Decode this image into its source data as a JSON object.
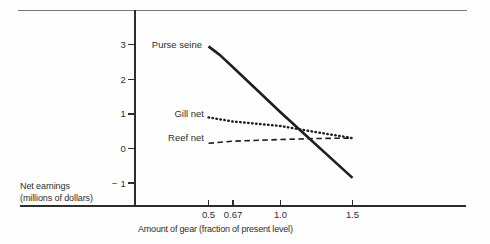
{
  "figure": {
    "background": "#fefefe",
    "top_rule_color": "#7a7a7a",
    "axis_color": "#2d2d2d",
    "text_color": "#2e2e2e",
    "series_line_color": "#1f1f1f"
  },
  "chart_data": {
    "type": "line",
    "title": "",
    "xlabel": "Amount of gear (fraction of present level)",
    "ylabel": "Net earnings (millions of dollars)",
    "ylabel_lines": [
      "Net earnings",
      "(millions of dollars)"
    ],
    "x_tick_values": [
      0.5,
      0.67,
      1.0,
      1.5
    ],
    "x_tick_labels": [
      "0.5",
      "0.67",
      "1.0",
      "1.5"
    ],
    "y_tick_values": [
      3,
      2,
      1,
      0,
      -1
    ],
    "y_tick_labels": [
      "3",
      "2",
      "1",
      "0",
      "− 1"
    ],
    "xlim": [
      0.0,
      2.3
    ],
    "ylim": [
      -1.7,
      4.0
    ],
    "grid": false,
    "legend_position": "inline-labels-left-of-lines",
    "series": [
      {
        "name": "Purse seine",
        "line_style": "solid",
        "x": [
          0.5,
          0.58,
          0.67,
          1.0,
          1.5
        ],
        "y": [
          2.95,
          2.7,
          2.35,
          1.05,
          -0.85
        ]
      },
      {
        "name": "Gill net",
        "line_style": "dotted",
        "x": [
          0.5,
          0.67,
          1.0,
          1.25,
          1.5
        ],
        "y": [
          0.9,
          0.78,
          0.65,
          0.47,
          0.3
        ]
      },
      {
        "name": "Reef net",
        "line_style": "dashed",
        "x": [
          0.5,
          0.67,
          1.0,
          1.25,
          1.5
        ],
        "y": [
          0.15,
          0.21,
          0.26,
          0.29,
          0.3
        ]
      }
    ]
  }
}
